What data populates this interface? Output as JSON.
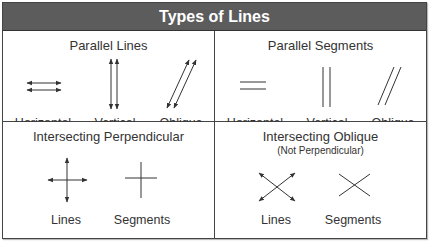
{
  "header": {
    "title": "Types of Lines",
    "bg_color": "#5c5c5c",
    "text_color": "#ffffff"
  },
  "panels": [
    {
      "title": "Parallel Lines",
      "items": [
        {
          "label": "Horizontal",
          "icon": "parallel-horizontal-lines-icon"
        },
        {
          "label": "Vertical",
          "icon": "parallel-vertical-lines-icon"
        },
        {
          "label": "Oblique",
          "icon": "parallel-oblique-lines-icon"
        }
      ]
    },
    {
      "title": "Parallel Segments",
      "items": [
        {
          "label": "Horizontal",
          "icon": "parallel-horizontal-segments-icon"
        },
        {
          "label": "Vertical",
          "icon": "parallel-vertical-segments-icon"
        },
        {
          "label": "Oblique",
          "icon": "parallel-oblique-segments-icon"
        }
      ]
    },
    {
      "title": "Intersecting Perpendicular",
      "items": [
        {
          "label": "Lines",
          "icon": "perpendicular-lines-icon"
        },
        {
          "label": "Segments",
          "icon": "perpendicular-segments-icon"
        }
      ]
    },
    {
      "title": "Intersecting Oblique",
      "subtitle": "(Not Perpendicular)",
      "items": [
        {
          "label": "Lines",
          "icon": "oblique-intersecting-lines-icon"
        },
        {
          "label": "Segments",
          "icon": "oblique-intersecting-segments-icon"
        }
      ]
    }
  ]
}
